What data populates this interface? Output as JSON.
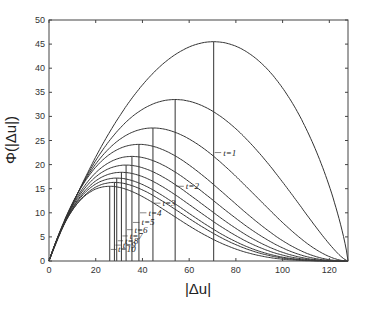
{
  "chart_data": {
    "type": "line",
    "title": "",
    "xlabel": "|Δu|",
    "ylabel": "Φ(|Δu|)",
    "xlim": [
      0,
      128
    ],
    "ylim": [
      0,
      50
    ],
    "xticks": [
      0,
      20,
      40,
      60,
      80,
      100,
      120
    ],
    "yticks": [
      0,
      5,
      10,
      15,
      20,
      25,
      30,
      35,
      40,
      45,
      50
    ],
    "grid": false,
    "legend": "none",
    "x_end": 128,
    "series": [
      {
        "name": "t=1",
        "peak_x": 70.5,
        "peak_y": 45.5,
        "label_x": 72,
        "label_y": 22.5
      },
      {
        "name": "t=2",
        "peak_x": 54,
        "peak_y": 33.5,
        "label_x": 56,
        "label_y": 15.5
      },
      {
        "name": "t=3",
        "peak_x": 44.5,
        "peak_y": 27.6,
        "label_x": 46,
        "label_y": 12.0
      },
      {
        "name": "t=4",
        "peak_x": 38.5,
        "peak_y": 24.2,
        "label_x": 40,
        "label_y": 10.0
      },
      {
        "name": "t=5",
        "peak_x": 35.5,
        "peak_y": 21.7,
        "label_x": 37,
        "label_y": 8.0
      },
      {
        "name": "t=6",
        "peak_x": 33,
        "peak_y": 19.9,
        "label_x": 34,
        "label_y": 6.5
      },
      {
        "name": "t=7",
        "peak_x": 31,
        "peak_y": 18.4,
        "label_x": 32,
        "label_y": 5.2
      },
      {
        "name": "t=8",
        "peak_x": 29,
        "peak_y": 17.2,
        "label_x": 30,
        "label_y": 4.2
      },
      {
        "name": "t=9",
        "peak_x": 28,
        "peak_y": 16.3,
        "label_x": 29,
        "label_y": 3.3
      },
      {
        "name": "t=10",
        "peak_x": 26,
        "peak_y": 15.5,
        "label_x": 27,
        "label_y": 2.4
      }
    ],
    "annotations": [
      "t=1",
      "t=2",
      "t=3",
      "t=4",
      "t=5",
      "t=6",
      "t=7",
      "t=8",
      "t=9",
      "t=10"
    ]
  },
  "axes": {
    "xlabel": "|Δu|",
    "ylabel": "Φ(|Δu|)"
  },
  "colors": {
    "line": "#333333",
    "axis": "#444444",
    "text": "#333333"
  }
}
